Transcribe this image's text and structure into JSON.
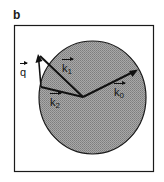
{
  "panel": {
    "label": "b"
  },
  "diagram": {
    "colors": {
      "frame": "#1a1a1a",
      "sphere_fill": "#9a9a9a",
      "lines": "#111111",
      "background": "#ffffff"
    },
    "sphere": {
      "cx": 92.5,
      "cy": 97.5,
      "rx": 53.5,
      "ry": 56.5
    },
    "origin": {
      "x": 83,
      "y": 97
    },
    "vectors": [
      {
        "id": "k0",
        "name": "k",
        "sub": "0",
        "from": [
          83,
          97
        ],
        "to": [
          137,
          70
        ],
        "label_pos": [
          118,
          77
        ]
      },
      {
        "id": "k1",
        "name": "k",
        "sub": "1",
        "from": [
          83,
          97
        ],
        "to": [
          38,
          55
        ],
        "label_pos": [
          62,
          63
        ]
      },
      {
        "id": "k2",
        "name": "k",
        "sub": "2",
        "from": [
          83,
          97
        ],
        "to": [
          41,
          87
        ],
        "label_pos": [
          50,
          96
        ]
      },
      {
        "id": "q",
        "name": "q",
        "sub": "",
        "from": [
          41,
          87
        ],
        "to": [
          38,
          55
        ],
        "label_pos": [
          20,
          67
        ]
      }
    ]
  }
}
